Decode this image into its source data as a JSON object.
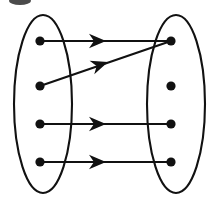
{
  "figure": {
    "name": "mapping-diagram",
    "width": 210,
    "height": 197,
    "background_color": "#ffffff",
    "ink_color": "#111111"
  },
  "sets": [
    {
      "name": "left-set",
      "shape": "ellipse",
      "cx": 43,
      "cy": 104,
      "rx": 29,
      "ry": 89,
      "stroke_width": 2.1,
      "dots": [
        {
          "name": "left-dot-1",
          "cx": 40,
          "cy": 41,
          "r": 4.6
        },
        {
          "name": "left-dot-2",
          "cx": 40,
          "cy": 86,
          "r": 4.6
        },
        {
          "name": "left-dot-3",
          "cx": 40,
          "cy": 124,
          "r": 4.6
        },
        {
          "name": "left-dot-4",
          "cx": 40,
          "cy": 162,
          "r": 4.6
        }
      ]
    },
    {
      "name": "right-set",
      "shape": "ellipse",
      "cx": 176,
      "cy": 104,
      "rx": 29,
      "ry": 89,
      "stroke_width": 2.1,
      "dots": [
        {
          "name": "right-dot-1",
          "cx": 171,
          "cy": 41,
          "r": 4.6
        },
        {
          "name": "right-dot-2",
          "cx": 171,
          "cy": 86,
          "r": 4.6
        },
        {
          "name": "right-dot-3",
          "cx": 171,
          "cy": 124,
          "r": 4.6
        },
        {
          "name": "right-dot-4",
          "cx": 171,
          "cy": 162,
          "r": 4.6
        }
      ]
    }
  ],
  "arrows": [
    {
      "name": "arrow-1",
      "from": "left-dot-1",
      "to": "right-dot-1",
      "x1": 40,
      "y1": 41,
      "x2": 171,
      "y2": 41,
      "head_x": 106,
      "head_y": 41,
      "head_angle": 0,
      "stroke_width": 2.2
    },
    {
      "name": "arrow-2",
      "from": "left-dot-2",
      "to": "right-dot-1",
      "x1": 40,
      "y1": 86,
      "x2": 171,
      "y2": 41,
      "head_x": 108,
      "head_y": 62,
      "head_angle": -19,
      "stroke_width": 2.2
    },
    {
      "name": "arrow-3",
      "from": "left-dot-3",
      "to": "right-dot-3",
      "x1": 40,
      "y1": 124,
      "x2": 171,
      "y2": 124,
      "head_x": 106,
      "head_y": 124,
      "head_angle": 0,
      "stroke_width": 2.2
    },
    {
      "name": "arrow-4",
      "from": "left-dot-4",
      "to": "right-dot-4",
      "x1": 40,
      "y1": 162,
      "x2": 171,
      "y2": 162,
      "head_x": 106,
      "head_y": 162,
      "head_angle": 0,
      "stroke_width": 2.2
    }
  ],
  "artifacts": [
    {
      "name": "top-left-smudge",
      "cx": 20,
      "cy": 1,
      "rx": 11,
      "ry": 4
    }
  ]
}
